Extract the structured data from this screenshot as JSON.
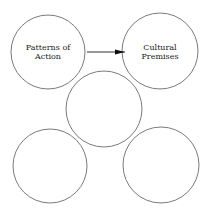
{
  "diagram": {
    "nodes": [
      {
        "id": "patterns",
        "lines": [
          "Patterns of",
          "Action"
        ],
        "cx": 48,
        "cy": 52,
        "r": 37
      },
      {
        "id": "premises",
        "lines": [
          "Cultural",
          "Premises"
        ],
        "cx": 160,
        "cy": 51,
        "r": 38
      },
      {
        "id": "middle",
        "lines": [],
        "cx": 104,
        "cy": 109,
        "r": 38
      },
      {
        "id": "bottom-left",
        "lines": [],
        "cx": 50,
        "cy": 166,
        "r": 37
      },
      {
        "id": "bottom-right",
        "lines": [],
        "cx": 161,
        "cy": 165,
        "r": 38
      }
    ],
    "edges": [
      {
        "from": "patterns",
        "to": "premises",
        "x1": 87,
        "y1": 52,
        "x2": 125,
        "y2": 52
      }
    ],
    "colors": {
      "stroke": "#7a7a7a",
      "arrow": "#111111",
      "text": "#222222"
    }
  }
}
